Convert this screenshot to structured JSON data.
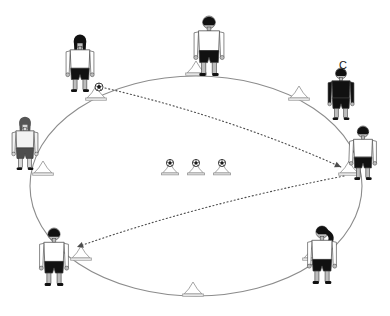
{
  "diagram": {
    "type": "sports-drill-diagram",
    "background_color": "#ffffff",
    "field": {
      "shape": "ellipse",
      "center_x": 196,
      "center_y": 186,
      "radius_x": 166,
      "radius_y": 110,
      "stroke_color": "#8c8c8c",
      "stroke_width": 1.1,
      "fill": "none"
    },
    "labels": [
      {
        "name": "coach-label",
        "text": "C",
        "x": 339,
        "y": 60,
        "color": "#1a1a1a",
        "font_size": 11
      }
    ],
    "perimeter_cones": [
      {
        "name": "cone-top-left",
        "x": 96,
        "y": 98,
        "has_ball": true
      },
      {
        "name": "cone-top-center",
        "x": 196,
        "y": 73,
        "has_ball": false
      },
      {
        "name": "cone-top-right",
        "x": 299,
        "y": 98,
        "has_ball": false
      },
      {
        "name": "cone-right",
        "x": 349,
        "y": 173,
        "has_ball": false
      },
      {
        "name": "cone-bottom-right",
        "x": 313,
        "y": 258,
        "has_ball": false
      },
      {
        "name": "cone-bottom-center",
        "x": 193,
        "y": 294,
        "has_ball": false
      },
      {
        "name": "cone-bottom-left",
        "x": 81,
        "y": 258,
        "has_ball": false
      },
      {
        "name": "cone-left",
        "x": 43,
        "y": 173,
        "has_ball": false
      }
    ],
    "center_cones": [
      {
        "name": "center-cone-1",
        "x": 170,
        "y": 173,
        "has_ball": true
      },
      {
        "name": "center-cone-2",
        "x": 196,
        "y": 173,
        "has_ball": true
      },
      {
        "name": "center-cone-3",
        "x": 222,
        "y": 173,
        "has_ball": true
      }
    ],
    "balls": [
      {
        "name": "ball-on-top-left-cone",
        "x": 99,
        "y": 87,
        "radius": 4.0
      },
      {
        "name": "ball-on-center-cone-1",
        "x": 170,
        "y": 163,
        "radius": 3.6
      },
      {
        "name": "ball-on-center-cone-2",
        "x": 196,
        "y": 163,
        "radius": 3.6
      },
      {
        "name": "ball-on-center-cone-3",
        "x": 222,
        "y": 163,
        "radius": 3.6
      }
    ],
    "players": [
      {
        "name": "player-top-left",
        "x": 80,
        "y": 36,
        "height": 56,
        "hair": "long",
        "shirt": "#ffffff",
        "shorts": "#111111",
        "tone": "dark",
        "facing": "front"
      },
      {
        "name": "player-top-center",
        "x": 209,
        "y": 16,
        "height": 60,
        "hair": "short",
        "shirt": "#ffffff",
        "shorts": "#111111",
        "tone": "dark",
        "facing": "front"
      },
      {
        "name": "player-left",
        "x": 25,
        "y": 118,
        "height": 52,
        "hair": "long",
        "shirt": "#f2f2f2",
        "shorts": "#4d4d4d",
        "tone": "light",
        "facing": "front"
      },
      {
        "name": "player-right",
        "x": 363,
        "y": 126,
        "height": 54,
        "hair": "short",
        "shirt": "#ffffff",
        "shorts": "#111111",
        "tone": "dark",
        "facing": "side"
      },
      {
        "name": "player-bottom-left",
        "x": 54,
        "y": 228,
        "height": 58,
        "hair": "short",
        "shirt": "#ffffff",
        "shorts": "#111111",
        "tone": "dark",
        "facing": "back"
      },
      {
        "name": "player-bottom-right",
        "x": 322,
        "y": 226,
        "height": 58,
        "hair": "ponytail",
        "shirt": "#ffffff",
        "shorts": "#111111",
        "tone": "dark",
        "facing": "back"
      }
    ],
    "coach": {
      "name": "coach-figure",
      "x": 341,
      "y": 68,
      "height": 52,
      "outfit_color": "#111111",
      "label": "C"
    },
    "arrows": [
      {
        "name": "pass-arrow-top-left-to-right-cone",
        "style": "dotted",
        "color": "#4d4d4d",
        "from": {
          "x": 105,
          "y": 88
        },
        "control": {
          "x": 232,
          "y": 118
        },
        "to": {
          "x": 341,
          "y": 167
        },
        "arrowhead": "filled-triangle"
      },
      {
        "name": "run-arrow-right-cone-to-bottom-left",
        "style": "dotted",
        "color": "#4d4d4d",
        "from": {
          "x": 344,
          "y": 176
        },
        "control": {
          "x": 196,
          "y": 205
        },
        "to": {
          "x": 77,
          "y": 247
        },
        "arrowhead": "filled-triangle"
      }
    ],
    "colors": {
      "field_stroke": "#8c8c8c",
      "cone_stroke": "#9a9a9a",
      "cone_fill": "#ffffff",
      "arrow": "#4d4d4d",
      "ball_dark": "#1a1a1a",
      "ball_light": "#ffffff",
      "figure_dark": "#111111",
      "figure_light": "#f2f2f2"
    }
  }
}
